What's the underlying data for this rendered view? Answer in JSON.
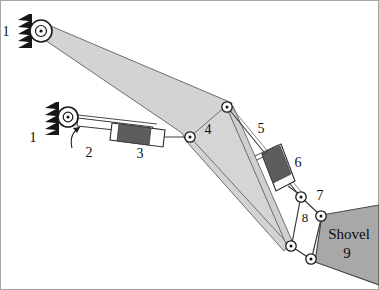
{
  "figure": {
    "background_color": "#ffffff",
    "border_color": "#9a9a9a",
    "width": 379,
    "height": 290
  },
  "colors": {
    "boom_fill": "#d3d3d3",
    "boom_stroke": "#6e6e6e",
    "shovel_fill": "#a8a8a8",
    "shovel_stroke": "#4a4a4a",
    "piston_dark": "#5d5d5d",
    "cylinder_light": "#fdfdfd",
    "link_stroke": "#3a3a3a",
    "ground_fill": "#161616",
    "joint_fill": "#ffffff",
    "joint_stroke": "#1a1a1a",
    "text_color": "#101010"
  },
  "labels": {
    "ground_upper": "1",
    "ground_lower": "1",
    "rod": "2",
    "cylinder_one": "3",
    "boom": "4",
    "link_five": "5",
    "cylinder_two": "6",
    "link_seven": "7",
    "link_eight": "8",
    "shovel_name": "Shovel",
    "shovel_number": "9"
  },
  "diagram_data": {
    "type": "kinematic-linkage",
    "description": "Planar excavator / shovel linkage with two hydraulic actuators",
    "joints": [
      {
        "id": "A",
        "name": "upper-ground-pivot",
        "x": 41,
        "y": 31,
        "radius": 10,
        "kind": "fixed-pivot"
      },
      {
        "id": "B",
        "name": "lower-ground-pivot",
        "x": 68,
        "y": 117,
        "radius": 9,
        "kind": "fixed-pivot"
      },
      {
        "id": "C",
        "name": "cylinder-boom-pivot",
        "x": 190,
        "y": 137,
        "radius": 5,
        "kind": "revolute"
      },
      {
        "id": "D",
        "name": "boom-upper-pivot",
        "x": 227,
        "y": 107,
        "radius": 5,
        "kind": "revolute"
      },
      {
        "id": "E",
        "name": "link5-cylinder6-pivot",
        "x": 301,
        "y": 197,
        "radius": 5,
        "kind": "revolute"
      },
      {
        "id": "F",
        "name": "link7-shovel-pivot",
        "x": 321,
        "y": 216,
        "radius": 5,
        "kind": "revolute"
      },
      {
        "id": "G",
        "name": "boom-tip-pivot",
        "x": 291,
        "y": 246,
        "radius": 5,
        "kind": "revolute"
      },
      {
        "id": "H",
        "name": "shovel-base-pivot",
        "x": 311,
        "y": 259,
        "radius": 5,
        "kind": "revolute"
      }
    ],
    "members": [
      {
        "id": "1",
        "name": "ground-frame",
        "type": "fixed-support",
        "count": 2
      },
      {
        "id": "2",
        "name": "piston-rod",
        "type": "slider-rod"
      },
      {
        "id": "3",
        "name": "hydraulic-cylinder-1",
        "type": "actuator"
      },
      {
        "id": "4",
        "name": "boom",
        "type": "ternary-link"
      },
      {
        "id": "5",
        "name": "connecting-link",
        "type": "binary-link"
      },
      {
        "id": "6",
        "name": "hydraulic-cylinder-2",
        "type": "actuator"
      },
      {
        "id": "7",
        "name": "coupler-link",
        "type": "binary-link"
      },
      {
        "id": "8",
        "name": "rocker-link",
        "type": "binary-link"
      },
      {
        "id": "9",
        "name": "shovel",
        "type": "end-effector"
      }
    ],
    "actuator_arrow": {
      "name": "motion-arrow",
      "near_label": "2",
      "direction": "curved-up-left"
    }
  }
}
